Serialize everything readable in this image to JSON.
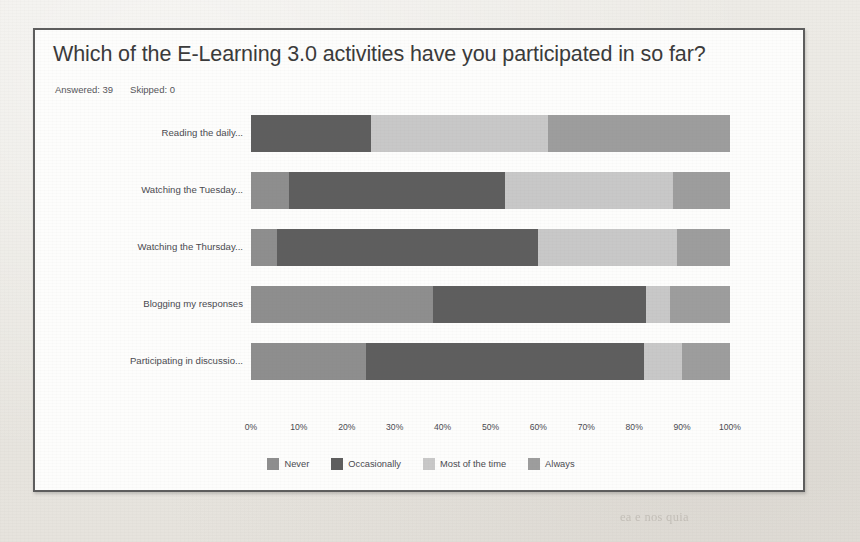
{
  "page": {
    "background_color": "#eceae5",
    "ghost_lines": [
      {
        "text": "n a reading-based assessment. Often in-class, Reed 11..., 14 ... level of",
        "x": 40,
        "y": 62
      },
      {
        "text": "tence to self-concept in MOOC 8",
        "x": 300,
        "y": 84
      },
      {
        "text": "s and cons",
        "x": 120,
        "y": 172
      },
      {
        "text": "ased, all to measure has the aid of comparing in course, must took",
        "x": 40,
        "y": 232
      },
      {
        "text": "s over time are more sensitive for assessment some reported",
        "x": 40,
        "y": 256
      },
      {
        "text": "to be collected in the course, and data for the following",
        "x": 40,
        "y": 280
      },
      {
        "text": "ach complete a session assessment of the one year",
        "x": 40,
        "y": 304
      },
      {
        "text": "e by a the course with the measurement models should",
        "x": 40,
        "y": 328
      },
      {
        "text": "s. Reliability coefficients is provided for each model",
        "x": 40,
        "y": 352
      },
      {
        "text": "e also reported and discussion of the other items. It",
        "x": 40,
        "y": 400
      },
      {
        "text": "d of the process, more proficiency to assessment makes",
        "x": 40,
        "y": 424
      },
      {
        "text": "ate using the MOOC comparisons of the scores. The",
        "x": 40,
        "y": 448
      },
      {
        "text": "s of assessment data in a class with the level and with",
        "x": 40,
        "y": 472
      },
      {
        "text": "ea e nos quia",
        "x": 620,
        "y": 510
      }
    ]
  },
  "chart_card": {
    "title": "Which of the E-Learning 3.0 activities have you participated in so far?",
    "answered_label": "Answered: 39",
    "skipped_label": "Skipped: 0",
    "border_color": "#5d5d5d",
    "background_color": "#fdfdfc"
  },
  "chart_data": {
    "type": "bar",
    "orientation": "horizontal",
    "stacked": true,
    "normalized_percent": true,
    "title": "Which of the E-Learning 3.0 activities have you participated in so far?",
    "xlabel": "",
    "ylabel": "",
    "xlim": [
      0,
      100
    ],
    "grid": false,
    "legend_position": "bottom-center",
    "categories": [
      "Reading the daily...",
      "Watching the Tuesday...",
      "Watching the Thursday...",
      "Blogging my responses",
      "Participating in discussio..."
    ],
    "series": [
      {
        "name": "Never",
        "color": "#8e8e8e",
        "values": [
          0,
          8,
          5.5,
          38,
          24
        ]
      },
      {
        "name": "Occasionally",
        "color": "#5e5e5e",
        "values": [
          25,
          45,
          54.5,
          44.5,
          58
        ]
      },
      {
        "name": "Most of the time",
        "color": "#c8c8c8",
        "values": [
          37,
          35,
          29,
          5,
          8
        ]
      },
      {
        "name": "Always",
        "color": "#9d9d9d",
        "values": [
          38,
          12,
          11,
          12.5,
          10
        ]
      }
    ],
    "xticks": [
      "0%",
      "10%",
      "20%",
      "30%",
      "40%",
      "50%",
      "60%",
      "70%",
      "80%",
      "90%",
      "100%"
    ],
    "xtick_values": [
      0,
      10,
      20,
      30,
      40,
      50,
      60,
      70,
      80,
      90,
      100
    ]
  }
}
